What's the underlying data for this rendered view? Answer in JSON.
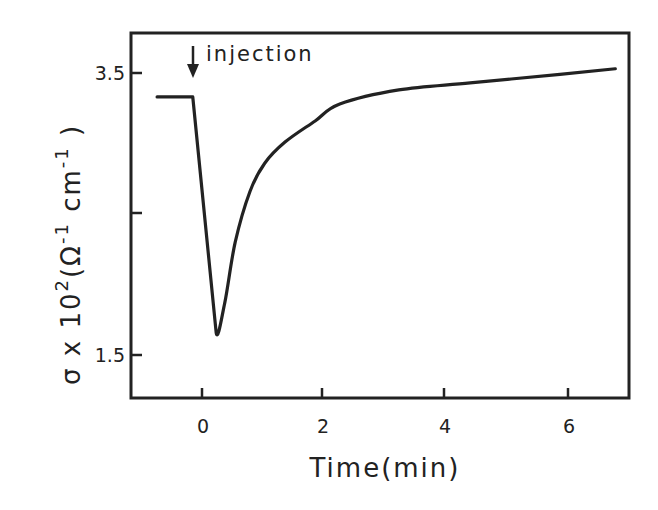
{
  "chart_data": {
    "type": "line",
    "title": "",
    "xlabel": "Time(min)",
    "ylabel": "σ x 10²(Ω⁻¹ cm⁻¹)",
    "xlim": [
      -0.8,
      7.0
    ],
    "ylim": [
      1.2,
      3.78
    ],
    "xticks": [
      0,
      2,
      4,
      6
    ],
    "xtick_labels": [
      "0",
      "2",
      "4",
      "6"
    ],
    "yticks": [
      1.5,
      2.5,
      3.5
    ],
    "ytick_labels": [
      "1.5",
      "",
      "3.5"
    ],
    "grid": false,
    "legend": null,
    "annotations": [
      {
        "text": "injection",
        "x": -0.15,
        "arrow": "down"
      }
    ],
    "series": [
      {
        "name": "conductivity",
        "x": [
          -0.73,
          -0.15,
          0.23,
          0.37,
          0.54,
          0.78,
          1.02,
          1.35,
          1.84,
          2.24,
          3.2,
          4.36,
          5.82,
          6.72
        ],
        "y": [
          3.33,
          3.33,
          1.66,
          1.87,
          2.3,
          2.66,
          2.86,
          3.01,
          3.16,
          3.28,
          3.38,
          3.43,
          3.49,
          3.53
        ]
      }
    ]
  },
  "labels": {
    "annotation": "injection",
    "xlabel": "Time(min)",
    "ylabel_sigma": "σ",
    "ylabel_rest": " x 10",
    "ylabel_exp2": "2",
    "ylabel_unit_open": "(Ω",
    "ylabel_exp_m1a": "-1",
    "ylabel_cm": " cm",
    "ylabel_exp_m1b": "-1",
    "ylabel_close": " )",
    "xtick_0": "0",
    "xtick_2": "2",
    "xtick_4": "4",
    "xtick_6": "6",
    "ytick_35": "3.5",
    "ytick_15": "1.5"
  }
}
